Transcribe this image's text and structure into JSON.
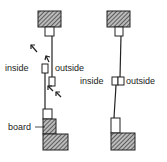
{
  "diagram": {
    "left": {
      "labels": {
        "inside": "inside",
        "outside": "outside",
        "board": "board"
      }
    },
    "right": {
      "labels": {
        "inside": "inside",
        "outside": "outside"
      }
    },
    "colors": {
      "stroke": "#222222",
      "hatch": "#444444",
      "background": "#ffffff"
    }
  }
}
